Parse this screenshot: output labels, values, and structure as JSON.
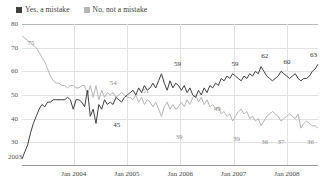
{
  "chart_data": {
    "type": "line",
    "title": "",
    "subtitle": "",
    "xlabel": "",
    "ylabel": "",
    "ylim": [
      20,
      80
    ],
    "yticks": [
      80,
      70,
      60,
      50,
      40,
      30
    ],
    "xticks": [
      "Jan 2004",
      "Jan 2005",
      "Jan 2006",
      "Jan 2007",
      "Jan 2008"
    ],
    "grid": true,
    "legend_position": "top-left",
    "start_label": "2003",
    "colors": {
      "yes_a_mistake": "#404040",
      "no_not_a_mistake": "#b5b5b5",
      "grid": "#e2e2e2",
      "axis": "#9a9a9a"
    },
    "series": [
      {
        "name": "Yes, a mistake",
        "color": "#404040",
        "values": [
          23,
          26,
          29,
          34,
          38,
          41,
          44,
          46,
          45,
          47,
          47,
          48,
          48,
          48,
          48,
          48,
          49,
          48,
          44,
          48,
          48,
          47,
          45,
          52,
          41,
          44,
          38,
          46,
          44,
          48,
          46,
          47,
          46,
          49,
          48,
          47,
          49,
          50,
          51,
          52,
          50,
          53,
          51,
          54,
          52,
          53,
          55,
          53,
          56,
          59,
          55,
          52,
          56,
          53,
          55,
          54,
          52,
          54,
          51,
          53,
          50,
          49,
          52,
          50,
          53,
          51,
          54,
          53,
          55,
          54,
          57,
          56,
          58,
          57,
          59,
          58,
          57,
          56,
          58,
          57,
          59,
          58,
          60,
          59,
          62,
          60,
          58,
          57,
          56,
          57,
          58,
          60,
          59,
          58,
          57,
          58,
          59,
          57,
          56,
          57,
          57,
          58,
          60,
          61,
          63
        ]
      },
      {
        "name": "No, not a mistake",
        "color": "#b5b5b5",
        "values": [
          75,
          74,
          73,
          72,
          71,
          70,
          68,
          66,
          64,
          61,
          58,
          56,
          55,
          55,
          54,
          54,
          53,
          54,
          54,
          53,
          53,
          54,
          54,
          50,
          54,
          49,
          54,
          48,
          52,
          49,
          51,
          50,
          51,
          49,
          50,
          51,
          50,
          49,
          49,
          48,
          50,
          47,
          49,
          46,
          48,
          47,
          45,
          47,
          44,
          41,
          45,
          47,
          44,
          46,
          44,
          45,
          47,
          45,
          48,
          46,
          49,
          50,
          47,
          49,
          46,
          48,
          45,
          46,
          44,
          45,
          42,
          43,
          41,
          42,
          39,
          41,
          43,
          44,
          42,
          43,
          40,
          41,
          39,
          40,
          37,
          39,
          41,
          42,
          43,
          42,
          41,
          39,
          40,
          41,
          42,
          41,
          40,
          42,
          36,
          38,
          39,
          38,
          37,
          37,
          36
        ]
      }
    ],
    "point_labels": [
      {
        "series": "No, not a mistake",
        "value": 75,
        "index": 0,
        "x_pct": 3.0,
        "y_pct": 10.5,
        "style": "light"
      },
      {
        "series": "No, not a mistake",
        "value": 54,
        "index": 23,
        "x_pct": 30.8,
        "y_pct": 38.5,
        "style": "light"
      },
      {
        "series": "Yes, a mistake",
        "value": 45,
        "index": 26,
        "x_pct": 32.0,
        "y_pct": 68.5,
        "style": "dark"
      },
      {
        "series": "No, not a mistake",
        "value": 51,
        "index": 40,
        "x_pct": 41.8,
        "y_pct": 44.5,
        "style": "light"
      },
      {
        "series": "Yes, a mistake",
        "value": 59,
        "index": 49,
        "x_pct": 52.5,
        "y_pct": 25.0,
        "style": "dark"
      },
      {
        "series": "No, not a mistake",
        "value": 39,
        "index": 55,
        "x_pct": 53.0,
        "y_pct": 77.0,
        "style": "light"
      },
      {
        "series": "Yes, a mistake",
        "value": 59,
        "index": 75,
        "x_pct": 72.0,
        "y_pct": 25.5,
        "style": "dark"
      },
      {
        "series": "No, not a mistake",
        "value": 49,
        "index": 63,
        "x_pct": 66.0,
        "y_pct": 57.0,
        "style": "light"
      },
      {
        "series": "Yes, a mistake",
        "value": 62,
        "index": 84,
        "x_pct": 82.0,
        "y_pct": 20.0,
        "style": "dark"
      },
      {
        "series": "Yes, a mistake",
        "value": 60,
        "index": 92,
        "x_pct": 89.5,
        "y_pct": 24.0,
        "style": "dark"
      },
      {
        "series": "Yes, a mistake",
        "value": 63,
        "index": 104,
        "x_pct": 98.5,
        "y_pct": 19.0,
        "style": "dark"
      },
      {
        "series": "No, not a mistake",
        "value": 39,
        "index": 74,
        "x_pct": 72.5,
        "y_pct": 78.5,
        "style": "light"
      },
      {
        "series": "No, not a mistake",
        "value": 36,
        "index": 84,
        "x_pct": 82.0,
        "y_pct": 80.5,
        "style": "light"
      },
      {
        "series": "No, not a mistake",
        "value": 37,
        "index": 90,
        "x_pct": 87.5,
        "y_pct": 80.5,
        "style": "light"
      },
      {
        "series": "No, not a mistake",
        "value": 36,
        "index": 104,
        "x_pct": 97.5,
        "y_pct": 80.5,
        "style": "light"
      }
    ]
  },
  "legend": {
    "items": [
      {
        "label": "Yes, a mistake",
        "color": "#404040"
      },
      {
        "label": "No, not a mistake",
        "color": "#b5b5b5"
      }
    ]
  }
}
